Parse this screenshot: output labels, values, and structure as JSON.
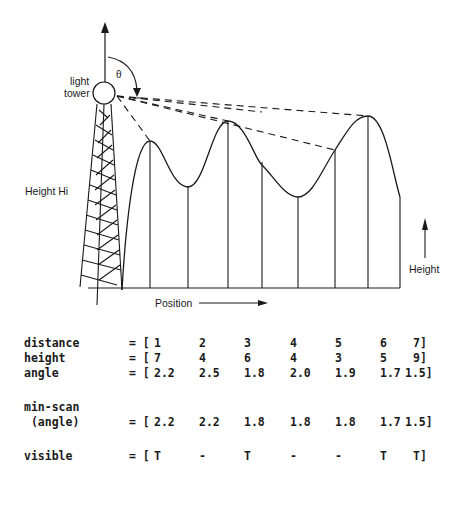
{
  "diagram": {
    "labels": {
      "tower": [
        "light",
        "tower"
      ],
      "theta": "θ",
      "height_hi": "Height Hi",
      "position": "Position",
      "height": "Height"
    },
    "terrain_points": [
      {
        "x": 150,
        "peak_y": 141
      },
      {
        "x": 188,
        "y": 187
      },
      {
        "x": 228,
        "peak_y": 121
      },
      {
        "x": 262,
        "y": 165
      },
      {
        "x": 298,
        "y": 197
      },
      {
        "x": 335,
        "y": 150
      },
      {
        "x": 368,
        "peak_y": 116
      },
      {
        "x": 400,
        "y": 197
      }
    ]
  },
  "table": {
    "rows": [
      {
        "name": "distance",
        "eq": "= [",
        "values": [
          "1",
          "2",
          "3",
          "4",
          "5",
          "6",
          "7]"
        ]
      },
      {
        "name": "height",
        "eq": "= [",
        "values": [
          "7",
          "4",
          "6",
          "4",
          "3",
          "5",
          "9]"
        ]
      },
      {
        "name": "angle",
        "eq": "= [",
        "values": [
          "2.2",
          "2.5",
          "1.8",
          "2.0",
          "1.9",
          "1.7",
          "1.5]"
        ]
      }
    ],
    "minscan": {
      "name_line1": "min-scan",
      "name_line2": " (angle)",
      "eq": "= [",
      "values": [
        "2.2",
        "2.2",
        "1.8",
        "1.8",
        "1.8",
        "1.7",
        "1.5]"
      ]
    },
    "visible": {
      "name": "visible",
      "eq": "= [",
      "values": [
        "T",
        "-",
        "T",
        "-",
        "-",
        "T",
        "T]"
      ]
    }
  }
}
